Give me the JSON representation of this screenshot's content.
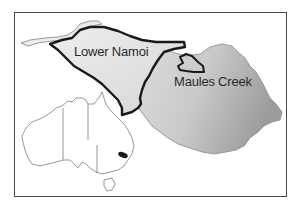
{
  "map": {
    "labels": {
      "lower_namoi": "Lower Namoi",
      "maules_creek": "Maules Creek"
    },
    "regions": [
      {
        "name": "Lower Namoi",
        "style": "light grey fill, thick black outline"
      },
      {
        "name": "Maules Creek",
        "style": "grey shaded relief, small black outlined sub-area"
      },
      {
        "name": "Australia inset",
        "style": "outline map with state borders, study area highlighted in black"
      }
    ],
    "colors": {
      "frame": "#4a4a4a",
      "outline": "#1a1a1a",
      "lower_namoi_fill": "#e4e4e4",
      "relief_light": "#d8d8d8",
      "relief_dark": "#9a9a9a",
      "strip": "#cfcfcf"
    }
  }
}
